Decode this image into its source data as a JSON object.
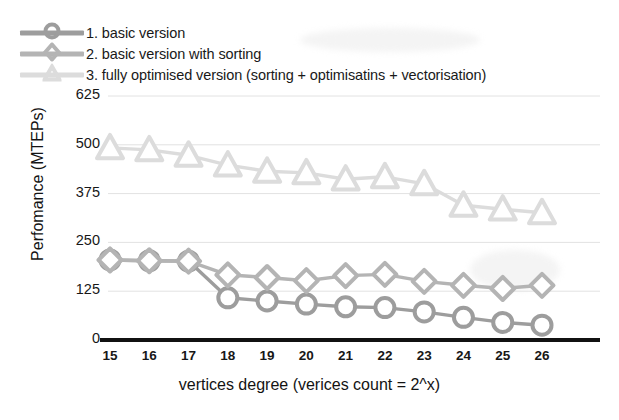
{
  "chart_data": {
    "type": "line",
    "title": "",
    "xlabel": "vertices degree (verices count = 2^x)",
    "ylabel": "Perfomance (MTEPs)",
    "categories": [
      15,
      16,
      17,
      18,
      19,
      20,
      21,
      22,
      23,
      24,
      25,
      26
    ],
    "xticklabels": [
      "15",
      "16",
      "17",
      "18",
      "19",
      "20",
      "21",
      "22",
      "23",
      "24",
      "25",
      "26"
    ],
    "yticklabels": [
      "0",
      "125",
      "250",
      "375",
      "500",
      "625"
    ],
    "yticks": [
      0,
      125,
      250,
      375,
      500,
      625
    ],
    "ylim": [
      0,
      625
    ],
    "xlim": [
      15,
      26
    ],
    "grid": true,
    "legend_position": "above-plot",
    "series": [
      {
        "name": "1. basic version",
        "marker": "circle",
        "color": "#9d9d9d",
        "values": [
          205,
          203,
          202,
          108,
          100,
          92,
          85,
          83,
          72,
          58,
          45,
          38
        ]
      },
      {
        "name": "2. basic version with sorting",
        "marker": "diamond",
        "color": "#b4b4b4",
        "values": [
          205,
          203,
          202,
          167,
          160,
          152,
          165,
          168,
          150,
          140,
          132,
          140
        ]
      },
      {
        "name": "3. fully optimised version (sorting + optimisatins + vectorisation)",
        "marker": "triangle",
        "color": "#dcdcdc",
        "values": [
          492,
          487,
          473,
          448,
          432,
          428,
          412,
          418,
          400,
          345,
          335,
          326
        ]
      }
    ]
  },
  "legend": {
    "items": [
      {
        "label": "1. basic version",
        "marker": "circle-marker-icon"
      },
      {
        "label": "2. basic version with sorting",
        "marker": "diamond-marker-icon"
      },
      {
        "label": "3. fully optimised version (sorting + optimisatins + vectorisation)",
        "marker": "triangle-marker-icon"
      }
    ]
  },
  "axes": {
    "x_title": "vertices degree (verices count = 2^x)",
    "y_title": "Perfomance (MTEPs)"
  },
  "colors": {
    "series1": "#9d9d9d",
    "series2": "#b4b4b4",
    "series3": "#dcdcdc",
    "axis": "#111111",
    "grid": "#e2e2e2",
    "text": "#171717",
    "background": "#ffffff"
  }
}
